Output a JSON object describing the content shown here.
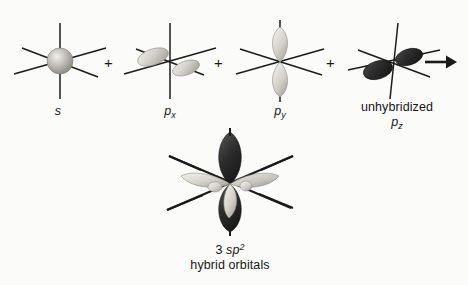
{
  "figure": {
    "type": "diagram",
    "background_color": "#fbfbfa",
    "line_color": "#1b1b1b",
    "lobe_light_color": "#d8d6cf",
    "lobe_dark_color": "#2a2a2a",
    "sphere_color": "#b8b6b0"
  },
  "terms": [
    {
      "id": "s-orbital",
      "label_plain": "s",
      "label_italic": "s",
      "subscript": "",
      "orbital_kind": "sphere",
      "shade": "light"
    },
    {
      "id": "px-orbital",
      "label_plain": "px",
      "label_italic": "p",
      "subscript": "x",
      "orbital_kind": "dumbbell-depth",
      "shade": "light"
    },
    {
      "id": "py-orbital",
      "label_plain": "py",
      "label_italic": "p",
      "subscript": "y",
      "orbital_kind": "dumbbell-vertical",
      "shade": "light"
    },
    {
      "id": "pz-orbital",
      "label_line1": "unhybridized",
      "label_italic": "p",
      "subscript": "z",
      "orbital_kind": "dumbbell-diagonal",
      "shade": "dark"
    }
  ],
  "operators": {
    "plus": "+",
    "arrow": "→"
  },
  "result": {
    "id": "sp2-hybrid",
    "count": "3",
    "orbital_italic": "sp",
    "superscript": "2",
    "caption_line2": "hybrid orbitals",
    "orbital_kind": "three-lobe-hybrid-plus-pz"
  }
}
